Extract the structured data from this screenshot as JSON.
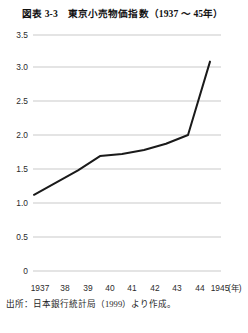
{
  "figure": {
    "title": "図表 3-3　東京小売物価指数（1937 ～ 45年）",
    "source": "出所：日本銀行統計局（1999）より作成。",
    "x_unit_label": "(年)"
  },
  "chart_data": {
    "type": "line",
    "title": "図表 3-3　東京小売物価指数（1937 ～ 45年）",
    "xlabel": "(年)",
    "ylabel": "",
    "categories": [
      "1937",
      "38",
      "39",
      "40",
      "41",
      "42",
      "43",
      "44",
      "1945"
    ],
    "x": [
      1937,
      1938,
      1939,
      1940,
      1941,
      1942,
      1943,
      1944,
      1945
    ],
    "values": [
      1.12,
      1.3,
      1.48,
      1.69,
      1.72,
      1.78,
      1.87,
      2.0,
      3.08
    ],
    "series": [
      {
        "name": "東京小売物価指数",
        "values": [
          1.12,
          1.3,
          1.48,
          1.69,
          1.72,
          1.78,
          1.87,
          2.0,
          3.08
        ]
      }
    ],
    "ylim": [
      0,
      3.5
    ],
    "yticks": [
      0,
      0.5,
      1.0,
      1.5,
      2.0,
      2.5,
      3.0,
      3.5
    ],
    "ytick_labels": [
      "0",
      "0.5",
      "1.0",
      "1.5",
      "2.0",
      "2.5",
      "3.0",
      "3.5"
    ],
    "grid": true,
    "grid_axis": "y",
    "legend": false,
    "line_color": "#1a1a1a",
    "grid_color": "#c9c9c9",
    "background": "#ffffff"
  },
  "axis": {
    "y_labels": [
      {
        "text": "3.5",
        "value": 3.5
      },
      {
        "text": "3.0",
        "value": 3.0
      },
      {
        "text": "2.5",
        "value": 2.5
      },
      {
        "text": "2.0",
        "value": 2.0
      },
      {
        "text": "1.5",
        "value": 1.5
      },
      {
        "text": "1.0",
        "value": 1.0
      },
      {
        "text": "0.5",
        "value": 0.5
      },
      {
        "text": "0",
        "value": 0
      }
    ],
    "x_labels": [
      {
        "text": "1937"
      },
      {
        "text": "38"
      },
      {
        "text": "39"
      },
      {
        "text": "40"
      },
      {
        "text": "41"
      },
      {
        "text": "42"
      },
      {
        "text": "43"
      },
      {
        "text": "44"
      },
      {
        "text": "1945"
      }
    ]
  }
}
